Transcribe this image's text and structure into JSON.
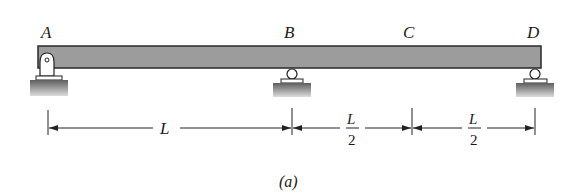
{
  "diagram": {
    "type": "beam",
    "caption": "(a)",
    "colors": {
      "beam_fill": "#9a9a9a",
      "beam_stroke": "#2a2a2a",
      "ground_top": "#6a6a6a",
      "ground_bottom": "#d8d8d8",
      "line": "#222222"
    },
    "points": [
      {
        "id": "A",
        "label": "A",
        "support": "pin"
      },
      {
        "id": "B",
        "label": "B",
        "support": "roller"
      },
      {
        "id": "C",
        "label": "C",
        "support": "none"
      },
      {
        "id": "D",
        "label": "D",
        "support": "roller"
      }
    ],
    "dimensions": [
      {
        "from": "A",
        "to": "B",
        "label": "L"
      },
      {
        "from": "B",
        "to": "C",
        "numerator": "L",
        "denominator": "2"
      },
      {
        "from": "C",
        "to": "D",
        "numerator": "L",
        "denominator": "2"
      }
    ]
  }
}
